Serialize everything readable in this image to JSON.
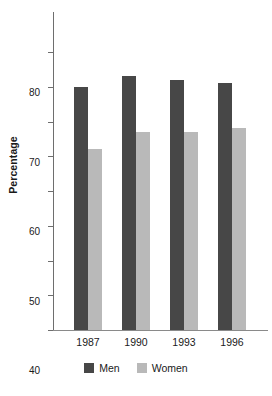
{
  "chart_data": {
    "type": "bar",
    "title": "",
    "xlabel": "",
    "ylabel": "Percentage",
    "categories": [
      "1987",
      "1990",
      "1993",
      "1996"
    ],
    "series": [
      {
        "name": "Men",
        "color": "#474747",
        "values": [
          70,
          73,
          72,
          71
        ]
      },
      {
        "name": "Women",
        "color": "#b9b9b9",
        "values": [
          52,
          57,
          57,
          58
        ]
      }
    ],
    "ylim": [
      0,
      80
    ],
    "yticks": [
      0,
      10,
      20,
      30,
      40,
      50,
      60,
      70,
      80
    ],
    "ytick_labels": [
      "0",
      "10",
      "20",
      "30",
      "40",
      "50",
      "60",
      "70",
      "80"
    ],
    "grid": false,
    "legend_position": "bottom"
  },
  "axes": {
    "y_title": "Percentage"
  },
  "legend": {
    "entries": [
      {
        "label": "Men"
      },
      {
        "label": "Women"
      }
    ]
  }
}
